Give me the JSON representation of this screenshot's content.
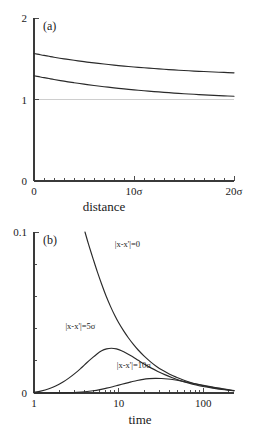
{
  "figure": {
    "background": "#ffffff",
    "curve_color": "#2a2a2a",
    "axis_color": "#3a3a3a",
    "refline_color": "#c9c9c9"
  },
  "chart_data": [
    {
      "id": "panel-a",
      "type": "line",
      "panel_label": "(a)",
      "title": "",
      "xlabel": "distance",
      "ylabel": "",
      "xscale": "linear",
      "yscale": "linear",
      "xlim": [
        0,
        20
      ],
      "ylim": [
        0,
        2
      ],
      "grid": false,
      "legend": "none",
      "xticks": [
        0,
        10,
        20
      ],
      "xticklabels": [
        "0",
        "10σ",
        "20σ"
      ],
      "xminorticks": [
        1,
        2,
        3,
        4,
        5,
        6,
        7,
        8,
        9,
        11,
        12,
        13,
        14,
        15,
        16,
        17,
        18,
        19
      ],
      "yticks": [
        0,
        1,
        2
      ],
      "yticklabels": [
        "0",
        "1",
        "2"
      ],
      "reference_lines": [
        {
          "y": 1,
          "color": "#c9c9c9"
        }
      ],
      "series": [
        {
          "name": "upper",
          "x": [
            0,
            0.5,
            1,
            1.5,
            2,
            3,
            4,
            5,
            6,
            7,
            8,
            9,
            10,
            11,
            12,
            13,
            14,
            15,
            16,
            17,
            18,
            19,
            20
          ],
          "values": [
            1.565,
            1.553,
            1.541,
            1.53,
            1.519,
            1.499,
            1.481,
            1.464,
            1.449,
            1.435,
            1.422,
            1.41,
            1.399,
            1.389,
            1.38,
            1.371,
            1.363,
            1.356,
            1.349,
            1.343,
            1.337,
            1.332,
            1.327
          ]
        },
        {
          "name": "lower",
          "x": [
            0,
            0.5,
            1,
            1.5,
            2,
            3,
            4,
            5,
            6,
            7,
            8,
            9,
            10,
            11,
            12,
            13,
            14,
            15,
            16,
            17,
            18,
            19,
            20
          ],
          "values": [
            1.292,
            1.28,
            1.268,
            1.257,
            1.246,
            1.225,
            1.206,
            1.188,
            1.172,
            1.157,
            1.143,
            1.13,
            1.118,
            1.107,
            1.097,
            1.088,
            1.079,
            1.071,
            1.064,
            1.057,
            1.051,
            1.045,
            1.04
          ]
        }
      ]
    },
    {
      "id": "panel-b",
      "type": "line",
      "panel_label": "(b)",
      "title": "",
      "xlabel": "time",
      "ylabel": "",
      "xscale": "log",
      "yscale": "linear",
      "xlim": [
        1,
        230
      ],
      "ylim": [
        0,
        0.1
      ],
      "grid": false,
      "legend": "inline-annotations",
      "xticks": [
        1,
        10,
        100
      ],
      "xticklabels": [
        "1",
        "10",
        "100"
      ],
      "xminorticks": [
        2,
        3,
        4,
        5,
        6,
        7,
        8,
        9,
        20,
        30,
        40,
        50,
        60,
        70,
        80,
        90,
        200
      ],
      "yticks": [
        0,
        0.1
      ],
      "yticklabels": [
        "0",
        "0.1"
      ],
      "yminorticks": [
        0.02,
        0.04,
        0.06,
        0.08
      ],
      "series": [
        {
          "name": "|x-x'|=0",
          "label": "|x-x'|=0",
          "label_x": 9.0,
          "label_y": 0.0905,
          "x": [
            4.0,
            4.4,
            5,
            5.6,
            6.3,
            7.1,
            8,
            9,
            10,
            11.5,
            13,
            15,
            17,
            20,
            24,
            28,
            33,
            40,
            48,
            57,
            68,
            82,
            100,
            120,
            145,
            175,
            210,
            230
          ],
          "values": [
            0.1,
            0.0925,
            0.0832,
            0.0752,
            0.0675,
            0.0602,
            0.0538,
            0.0481,
            0.0436,
            0.0384,
            0.0343,
            0.03,
            0.0267,
            0.0229,
            0.0192,
            0.0165,
            0.0141,
            0.0117,
            0.0098,
            0.0082,
            0.0068,
            0.0056,
            0.0045,
            0.0037,
            0.0029,
            0.0023,
            0.0017,
            0.0014
          ]
        },
        {
          "name": "|x-x'|=5σ",
          "label": "|x-x'|=5σ",
          "label_x": 2.35,
          "label_y": 0.0395,
          "x": [
            1,
            1.2,
            1.5,
            1.8,
            2.2,
            2.6,
            3.1,
            3.6,
            4.2,
            4.8,
            5.5,
            6.3,
            7.2,
            8.2,
            9.4,
            10.8,
            12.5,
            14.5,
            17,
            20,
            24,
            29,
            35,
            43,
            53,
            66,
            82,
            103,
            130,
            165,
            200,
            230
          ],
          "values": [
            0.0005,
            0.0012,
            0.0026,
            0.0043,
            0.0068,
            0.0094,
            0.0125,
            0.0155,
            0.0188,
            0.0215,
            0.0241,
            0.0262,
            0.0274,
            0.0278,
            0.0274,
            0.0263,
            0.0246,
            0.0226,
            0.0203,
            0.018,
            0.0156,
            0.0134,
            0.0114,
            0.0095,
            0.0078,
            0.0063,
            0.005,
            0.0039,
            0.003,
            0.0022,
            0.0017,
            0.0014
          ]
        },
        {
          "name": "|x-x'|=10σ",
          "label": "|x-x'|=10σ",
          "label_x": 9.5,
          "label_y": 0.0158,
          "x": [
            1,
            1.5,
            2,
            2.6,
            3.2,
            4,
            5,
            6,
            7.2,
            8.5,
            10,
            12,
            14,
            16.5,
            19.5,
            23,
            27,
            32,
            38,
            45,
            54,
            65,
            80,
            100,
            125,
            155,
            195,
            230
          ],
          "values": [
            0.0,
            0.0,
            0.0001,
            0.0002,
            0.0004,
            0.0008,
            0.0014,
            0.0021,
            0.003,
            0.0039,
            0.0049,
            0.006,
            0.0069,
            0.0078,
            0.0085,
            0.0089,
            0.0091,
            0.009,
            0.0087,
            0.0082,
            0.0075,
            0.0067,
            0.0057,
            0.0047,
            0.0038,
            0.003,
            0.0021,
            0.0015
          ]
        }
      ]
    }
  ]
}
